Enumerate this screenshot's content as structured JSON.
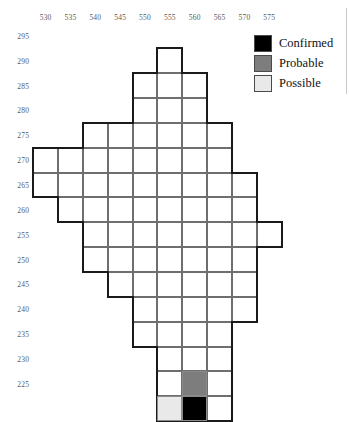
{
  "chart_data": {
    "type": "heatmap",
    "title": "",
    "xlabel": "",
    "ylabel": "",
    "grid": true,
    "cell_size": 5,
    "x_ticks": [
      530,
      535,
      540,
      545,
      550,
      555,
      560,
      565,
      570,
      575
    ],
    "y_ticks": [
      295,
      290,
      285,
      280,
      275,
      270,
      265,
      260,
      255,
      250,
      245,
      240,
      235,
      230,
      225
    ],
    "xlim": [
      527.5,
      577.5
    ],
    "ylim": [
      222.5,
      297.5
    ],
    "legend": {
      "position": "top-right",
      "entries": [
        {
          "label": "Confirmed",
          "color": "#000000"
        },
        {
          "label": "Probable",
          "color": "#7d7d7d"
        },
        {
          "label": "Possible",
          "color": "#e9e9e9"
        }
      ]
    },
    "categories": [
      "Confirmed",
      "Probable",
      "Possible",
      "Unclassified"
    ],
    "cells": [
      {
        "x": 552.5,
        "y": 292.5,
        "status": "Unclassified"
      },
      {
        "x": 547.5,
        "y": 287.5,
        "status": "Unclassified"
      },
      {
        "x": 552.5,
        "y": 287.5,
        "status": "Unclassified"
      },
      {
        "x": 557.5,
        "y": 287.5,
        "status": "Unclassified"
      },
      {
        "x": 547.5,
        "y": 282.5,
        "status": "Unclassified"
      },
      {
        "x": 552.5,
        "y": 282.5,
        "status": "Unclassified"
      },
      {
        "x": 557.5,
        "y": 282.5,
        "status": "Unclassified"
      },
      {
        "x": 537.5,
        "y": 277.5,
        "status": "Unclassified"
      },
      {
        "x": 542.5,
        "y": 277.5,
        "status": "Unclassified"
      },
      {
        "x": 547.5,
        "y": 277.5,
        "status": "Unclassified"
      },
      {
        "x": 552.5,
        "y": 277.5,
        "status": "Unclassified"
      },
      {
        "x": 557.5,
        "y": 277.5,
        "status": "Unclassified"
      },
      {
        "x": 562.5,
        "y": 277.5,
        "status": "Unclassified"
      },
      {
        "x": 527.5,
        "y": 272.5,
        "status": "Unclassified"
      },
      {
        "x": 532.5,
        "y": 272.5,
        "status": "Unclassified"
      },
      {
        "x": 537.5,
        "y": 272.5,
        "status": "Unclassified"
      },
      {
        "x": 542.5,
        "y": 272.5,
        "status": "Unclassified"
      },
      {
        "x": 547.5,
        "y": 272.5,
        "status": "Unclassified"
      },
      {
        "x": 552.5,
        "y": 272.5,
        "status": "Unclassified"
      },
      {
        "x": 557.5,
        "y": 272.5,
        "status": "Unclassified"
      },
      {
        "x": 562.5,
        "y": 272.5,
        "status": "Unclassified"
      },
      {
        "x": 527.5,
        "y": 267.5,
        "status": "Unclassified"
      },
      {
        "x": 532.5,
        "y": 267.5,
        "status": "Unclassified"
      },
      {
        "x": 537.5,
        "y": 267.5,
        "status": "Unclassified"
      },
      {
        "x": 542.5,
        "y": 267.5,
        "status": "Unclassified"
      },
      {
        "x": 547.5,
        "y": 267.5,
        "status": "Unclassified"
      },
      {
        "x": 552.5,
        "y": 267.5,
        "status": "Unclassified"
      },
      {
        "x": 557.5,
        "y": 267.5,
        "status": "Unclassified"
      },
      {
        "x": 562.5,
        "y": 267.5,
        "status": "Unclassified"
      },
      {
        "x": 567.5,
        "y": 267.5,
        "status": "Unclassified"
      },
      {
        "x": 532.5,
        "y": 262.5,
        "status": "Unclassified"
      },
      {
        "x": 537.5,
        "y": 262.5,
        "status": "Unclassified"
      },
      {
        "x": 542.5,
        "y": 262.5,
        "status": "Unclassified"
      },
      {
        "x": 547.5,
        "y": 262.5,
        "status": "Unclassified"
      },
      {
        "x": 552.5,
        "y": 262.5,
        "status": "Unclassified"
      },
      {
        "x": 557.5,
        "y": 262.5,
        "status": "Unclassified"
      },
      {
        "x": 562.5,
        "y": 262.5,
        "status": "Unclassified"
      },
      {
        "x": 567.5,
        "y": 262.5,
        "status": "Unclassified"
      },
      {
        "x": 537.5,
        "y": 257.5,
        "status": "Unclassified"
      },
      {
        "x": 542.5,
        "y": 257.5,
        "status": "Unclassified"
      },
      {
        "x": 547.5,
        "y": 257.5,
        "status": "Unclassified"
      },
      {
        "x": 552.5,
        "y": 257.5,
        "status": "Unclassified"
      },
      {
        "x": 557.5,
        "y": 257.5,
        "status": "Unclassified"
      },
      {
        "x": 562.5,
        "y": 257.5,
        "status": "Unclassified"
      },
      {
        "x": 567.5,
        "y": 257.5,
        "status": "Unclassified"
      },
      {
        "x": 572.5,
        "y": 257.5,
        "status": "Unclassified"
      },
      {
        "x": 537.5,
        "y": 252.5,
        "status": "Unclassified"
      },
      {
        "x": 542.5,
        "y": 252.5,
        "status": "Unclassified"
      },
      {
        "x": 547.5,
        "y": 252.5,
        "status": "Unclassified"
      },
      {
        "x": 552.5,
        "y": 252.5,
        "status": "Unclassified"
      },
      {
        "x": 557.5,
        "y": 252.5,
        "status": "Unclassified"
      },
      {
        "x": 562.5,
        "y": 252.5,
        "status": "Unclassified"
      },
      {
        "x": 567.5,
        "y": 252.5,
        "status": "Unclassified"
      },
      {
        "x": 542.5,
        "y": 247.5,
        "status": "Unclassified"
      },
      {
        "x": 547.5,
        "y": 247.5,
        "status": "Unclassified"
      },
      {
        "x": 552.5,
        "y": 247.5,
        "status": "Unclassified"
      },
      {
        "x": 557.5,
        "y": 247.5,
        "status": "Unclassified"
      },
      {
        "x": 562.5,
        "y": 247.5,
        "status": "Unclassified"
      },
      {
        "x": 567.5,
        "y": 247.5,
        "status": "Unclassified"
      },
      {
        "x": 547.5,
        "y": 242.5,
        "status": "Unclassified"
      },
      {
        "x": 552.5,
        "y": 242.5,
        "status": "Unclassified"
      },
      {
        "x": 557.5,
        "y": 242.5,
        "status": "Unclassified"
      },
      {
        "x": 562.5,
        "y": 242.5,
        "status": "Unclassified"
      },
      {
        "x": 567.5,
        "y": 242.5,
        "status": "Unclassified"
      },
      {
        "x": 547.5,
        "y": 237.5,
        "status": "Unclassified"
      },
      {
        "x": 552.5,
        "y": 237.5,
        "status": "Unclassified"
      },
      {
        "x": 557.5,
        "y": 237.5,
        "status": "Unclassified"
      },
      {
        "x": 562.5,
        "y": 237.5,
        "status": "Unclassified"
      },
      {
        "x": 552.5,
        "y": 232.5,
        "status": "Unclassified"
      },
      {
        "x": 557.5,
        "y": 232.5,
        "status": "Unclassified"
      },
      {
        "x": 562.5,
        "y": 232.5,
        "status": "Unclassified"
      },
      {
        "x": 552.5,
        "y": 227.5,
        "status": "Unclassified"
      },
      {
        "x": 557.5,
        "y": 227.5,
        "status": "Probable"
      },
      {
        "x": 562.5,
        "y": 227.5,
        "status": "Unclassified"
      },
      {
        "x": 552.5,
        "y": 222.5,
        "status": "Possible"
      },
      {
        "x": 557.5,
        "y": 222.5,
        "status": "Confirmed"
      },
      {
        "x": 562.5,
        "y": 222.5,
        "status": "Unclassified"
      }
    ]
  },
  "axis": {
    "x_tick_labels": [
      "530",
      "535",
      "540",
      "545",
      "550",
      "555",
      "560",
      "565",
      "570",
      "575"
    ],
    "y_tick_labels": [
      "295",
      "290",
      "285",
      "280",
      "275",
      "270",
      "265",
      "260",
      "255",
      "250",
      "245",
      "240",
      "235",
      "230",
      "225"
    ]
  },
  "legend": {
    "items": [
      {
        "label": "Confirmed",
        "color": "#000000"
      },
      {
        "label": "Probable",
        "color": "#7d7d7d"
      },
      {
        "label": "Possible",
        "color": "#e9e9e9"
      }
    ]
  }
}
